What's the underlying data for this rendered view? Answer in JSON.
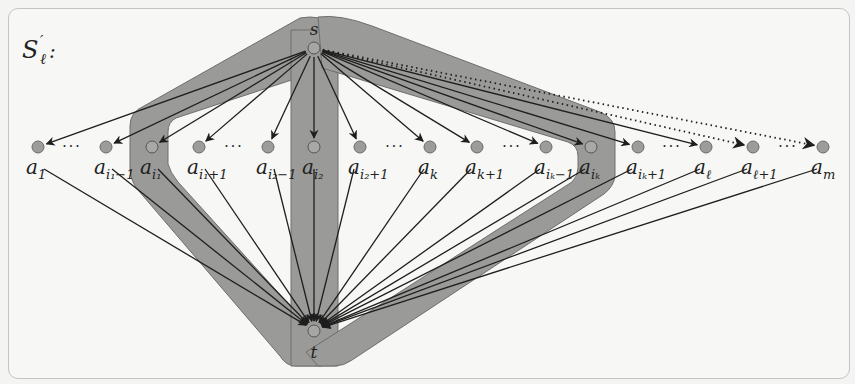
{
  "figure": {
    "title_label": "S",
    "title_prime": "′",
    "title_sub": "ℓ",
    "title_colon": ":",
    "source": {
      "name": "s",
      "x": 314,
      "y": 48
    },
    "sink": {
      "name": "t",
      "x": 314,
      "y": 330
    },
    "node_row_y": 147,
    "nodes": [
      {
        "id": "a1",
        "base": "a",
        "sub": "1",
        "x": 38,
        "highlighted": false,
        "edge": "solid"
      },
      {
        "id": "ai1m1",
        "base": "a",
        "sub": "i₁−1",
        "x": 106,
        "highlighted": false,
        "edge": "solid"
      },
      {
        "id": "ai1",
        "base": "a",
        "sub": "i₁",
        "x": 152,
        "highlighted": true,
        "edge": "solid"
      },
      {
        "id": "ai1p1",
        "base": "a",
        "sub": "i₁+1",
        "x": 199,
        "highlighted": false,
        "edge": "solid"
      },
      {
        "id": "ai2m1",
        "base": "a",
        "sub": "i₂−1",
        "x": 268,
        "highlighted": false,
        "edge": "solid"
      },
      {
        "id": "ai2",
        "base": "a",
        "sub": "i₂",
        "x": 314,
        "highlighted": true,
        "edge": "solid"
      },
      {
        "id": "ai2p1",
        "base": "a",
        "sub": "i₂+1",
        "x": 360,
        "highlighted": false,
        "edge": "solid"
      },
      {
        "id": "ak",
        "base": "a",
        "sub": "k",
        "x": 430,
        "highlighted": false,
        "edge": "solid"
      },
      {
        "id": "akp1",
        "base": "a",
        "sub": "k+1",
        "x": 477,
        "highlighted": false,
        "edge": "solid"
      },
      {
        "id": "aikm1",
        "base": "a",
        "sub": "iₖ−1",
        "x": 546,
        "highlighted": false,
        "edge": "solid"
      },
      {
        "id": "aik",
        "base": "a",
        "sub": "iₖ",
        "x": 591,
        "highlighted": true,
        "edge": "solid"
      },
      {
        "id": "aikp1",
        "base": "a",
        "sub": "iₖ+1",
        "x": 638,
        "highlighted": false,
        "edge": "solid"
      },
      {
        "id": "al",
        "base": "a",
        "sub": "ℓ",
        "x": 706,
        "highlighted": false,
        "edge": "solid"
      },
      {
        "id": "alp1",
        "base": "a",
        "sub": "ℓ+1",
        "x": 753,
        "highlighted": false,
        "edge": "dotted"
      },
      {
        "id": "am",
        "base": "a",
        "sub": "m",
        "x": 823,
        "highlighted": false,
        "edge": "dotted"
      }
    ],
    "ellipses": [
      {
        "x": 72,
        "text": "···"
      },
      {
        "x": 234,
        "text": "···"
      },
      {
        "x": 395,
        "text": "···"
      },
      {
        "x": 512,
        "text": "···"
      },
      {
        "x": 672,
        "text": "···"
      },
      {
        "x": 788,
        "text": "···"
      }
    ],
    "colors": {
      "band_fill": "#9a9a98",
      "band_stroke": "#6e6e6c",
      "node_fill": "#9c9c9a",
      "node_stroke": "#6a6a68",
      "edge": "#1e1e1e"
    }
  }
}
